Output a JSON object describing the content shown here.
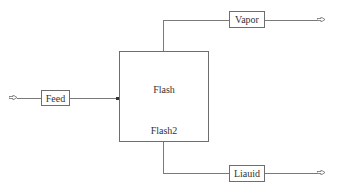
{
  "diagram": {
    "type": "process-flowsheet",
    "block": {
      "name": "Flash",
      "id": "Flash2"
    },
    "streams": {
      "feed": {
        "label": "Feed",
        "direction": "inlet"
      },
      "vapor": {
        "label": "Vapor",
        "direction": "outlet"
      },
      "liquid": {
        "label": "Liauid",
        "direction": "outlet"
      }
    },
    "colors": {
      "line": "#7a7a7a",
      "border": "#6e6e6e",
      "text": "#333333"
    }
  }
}
